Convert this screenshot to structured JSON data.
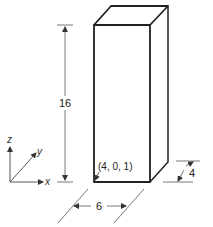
{
  "figure": {
    "type": "isometric box diagram",
    "dimensions": {
      "height": "16",
      "width": "6",
      "depth": "4"
    },
    "corner_label": "(4, 0, 1)",
    "axes": {
      "z": "z",
      "y": "y",
      "x": "x"
    }
  }
}
